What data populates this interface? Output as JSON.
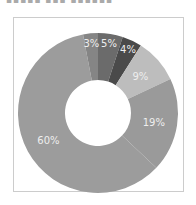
{
  "chart_data": {
    "type": "pie",
    "variant": "donut",
    "title": "",
    "slices": [
      {
        "label": "5%",
        "value": 5,
        "color": "#6b6b6b"
      },
      {
        "label": "4%",
        "value": 4,
        "color": "#4a4a4a"
      },
      {
        "label": "9%",
        "value": 9,
        "color": "#bdbdbd"
      },
      {
        "label": "19%",
        "value": 19,
        "color": "#9a9a9a"
      },
      {
        "label": "60%",
        "value": 60,
        "color": "#9c9c9c"
      },
      {
        "label": "3%",
        "value": 3,
        "color": "#858585"
      }
    ],
    "start_angle": "12 o'clock",
    "direction": "clockwise"
  }
}
